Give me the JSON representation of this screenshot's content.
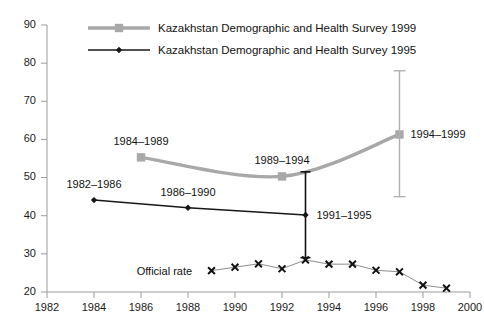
{
  "chart_data": {
    "type": "line",
    "title": "",
    "subtitle": "",
    "xlabel": "",
    "ylabel": "",
    "xlim": [
      1982,
      2000
    ],
    "ylim": [
      20,
      90
    ],
    "xticks": [
      1982,
      1984,
      1986,
      1988,
      1990,
      1992,
      1994,
      1996,
      1998,
      2000
    ],
    "yticks": [
      20,
      30,
      40,
      50,
      60,
      70,
      80,
      90
    ],
    "grid": false,
    "legend_position": "top-left",
    "series": [
      {
        "name": "Kazakhstan Demographic and Health Survey 1999",
        "color": "#a8a8a8",
        "marker": "square",
        "x": [
          1986,
          1992,
          1997
        ],
        "values": [
          55.3,
          50.3,
          61.3
        ],
        "point_labels": [
          "1984–1989",
          "1989–1994",
          "1994–1999"
        ]
      },
      {
        "name": "Kazakhstan Demographic and Health Survey 1995",
        "color": "#171717",
        "marker": "diamond",
        "x": [
          1984,
          1988,
          1993
        ],
        "values": [
          44.1,
          42.1,
          40.2
        ],
        "point_labels": [
          "1982–1986",
          "1986–1990",
          "1991–1995"
        ]
      },
      {
        "name": "Official rate",
        "color": "#8d8d8d",
        "marker": "x",
        "x": [
          1989,
          1990,
          1991,
          1992,
          1993,
          1994,
          1995,
          1996,
          1997,
          1998,
          1999
        ],
        "values": [
          25.6,
          26.5,
          27.4,
          26.1,
          28.4,
          27.3,
          27.3,
          25.7,
          25.3,
          21.8,
          21.0
        ],
        "point_labels": []
      }
    ],
    "error_bars": [
      {
        "series": "Kazakhstan Demographic and Health Survey 1995",
        "x": 1993,
        "value": 40.2,
        "low": 29.0,
        "high": 51.5,
        "color": "#111111"
      },
      {
        "series": "Kazakhstan Demographic and Health Survey 1999",
        "x": 1997,
        "value": 61.3,
        "low": 45.0,
        "high": 78.0,
        "color": "#b0b0b0"
      }
    ],
    "annotations": [
      {
        "text": "1984–1989",
        "x": 1986,
        "value": 55.3,
        "placement": "above"
      },
      {
        "text": "1989–1994",
        "x": 1992,
        "value": 50.3,
        "placement": "above"
      },
      {
        "text": "1994–1999",
        "x": 1997,
        "value": 61.3,
        "placement": "right"
      },
      {
        "text": "1982–1986",
        "x": 1984,
        "value": 44.1,
        "placement": "above"
      },
      {
        "text": "1986–1990",
        "x": 1988,
        "value": 42.1,
        "placement": "above"
      },
      {
        "text": "1991–1995",
        "x": 1993,
        "value": 40.2,
        "placement": "right"
      },
      {
        "text": "Official rate",
        "x": 1988.6,
        "value": 25.6,
        "placement": "left"
      }
    ]
  },
  "legend": {
    "items": [
      {
        "label": "Kazakhstan Demographic and Health Survey 1999",
        "color": "#a8a8a8",
        "marker": "square"
      },
      {
        "label": "Kazakhstan Demographic and Health Survey 1995",
        "color": "#171717",
        "marker": "diamond"
      }
    ]
  },
  "axes": {
    "y_tick_labels": [
      "90",
      "80",
      "70",
      "60",
      "50",
      "40",
      "30",
      "20"
    ],
    "x_tick_labels": [
      "1982",
      "1984",
      "1986",
      "1988",
      "1990",
      "1992",
      "1994",
      "1996",
      "1998",
      "2000"
    ]
  }
}
